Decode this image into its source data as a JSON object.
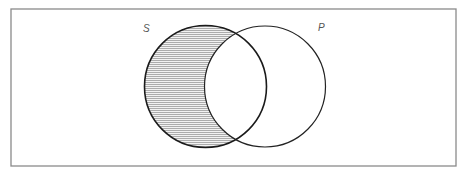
{
  "diagram": {
    "type": "venn",
    "frame": {
      "x": 11,
      "y": 9,
      "width": 445,
      "height": 157,
      "stroke": "#8a8a8a"
    },
    "sets": [
      {
        "id": "S",
        "label": "S",
        "cx": 205.5,
        "cy": 86.5,
        "r": 61,
        "stroke": "#1a1a1a",
        "label_x": 143,
        "label_y": 32
      },
      {
        "id": "P",
        "label": "P",
        "cx": 265,
        "cy": 86.5,
        "r": 60.5,
        "stroke": "#222222",
        "label_x": 318,
        "label_y": 31
      }
    ],
    "shaded_region": {
      "description": "S minus P",
      "pattern": "horizontal-lines",
      "line_spacing": 2,
      "line_color": "#9a9a9a",
      "background": "#f2f2f2"
    }
  }
}
